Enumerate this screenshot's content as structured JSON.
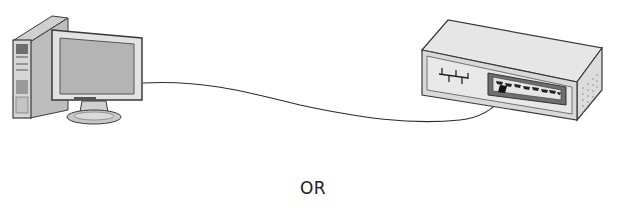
{
  "diagram": {
    "type": "network-connection",
    "nodes": [
      {
        "id": "computer",
        "label": "Desktop computer (tower + monitor)"
      },
      {
        "id": "switch",
        "label": "Network switch with 8 ports"
      }
    ],
    "edges": [
      {
        "from": "computer",
        "to": "switch",
        "label": "Ethernet cable"
      }
    ],
    "switch_port_count": 8
  },
  "caption": {
    "or_text": "OR"
  },
  "colors": {
    "outline": "#3a3a3a",
    "body_fill": "#d9d9d9",
    "panel_fill": "#e8e8e8",
    "dark_fill": "#6e6e6e",
    "screen_fill": "#b4b4b4"
  }
}
